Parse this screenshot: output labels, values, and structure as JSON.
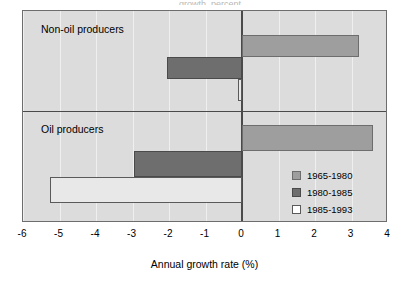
{
  "chart_data": {
    "type": "bar",
    "orientation": "horizontal",
    "title": "",
    "xlabel": "Annual growth rate (%)",
    "ylabel": "",
    "xlim": [
      -6,
      4
    ],
    "xticks": [
      -6,
      -5,
      -4,
      -3,
      -2,
      -1,
      0,
      1,
      2,
      3,
      4
    ],
    "xtick_labels": [
      "-6",
      "-5",
      "-4",
      "-3",
      "-2",
      "-1",
      "0",
      "1",
      "2",
      "3",
      "4"
    ],
    "grid": true,
    "legend_position": "inside-right",
    "panels": [
      {
        "label": "Non-oil producers",
        "values": [
          3.2,
          -2.05,
          -0.1
        ]
      },
      {
        "label": "Oil producers",
        "values": [
          3.6,
          -2.95,
          -5.25
        ]
      }
    ],
    "series": [
      {
        "name": "1965-1980",
        "color": "#9e9e9e",
        "values": [
          3.2,
          3.6
        ]
      },
      {
        "name": "1980-1985",
        "color": "#6e6e6e",
        "values": [
          -2.05,
          -2.95
        ]
      },
      {
        "name": "1985-1993",
        "color": "#ffffff",
        "values": [
          -0.1,
          -5.25
        ]
      }
    ],
    "categories": [
      "Non-oil producers",
      "Oil producers"
    ]
  },
  "legend": {
    "items": [
      {
        "label": "1965-1980"
      },
      {
        "label": "1980-1985"
      },
      {
        "label": "1985-1993"
      }
    ]
  },
  "axis": {
    "title": "Annual growth rate (%)",
    "ticks": [
      "-6",
      "-5",
      "-4",
      "-3",
      "-2",
      "-1",
      "0",
      "1",
      "2",
      "3",
      "4"
    ]
  },
  "panels": {
    "top_label": "Non-oil producers",
    "bottom_label": "Oil producers"
  },
  "title_sliver": "growth, percent"
}
